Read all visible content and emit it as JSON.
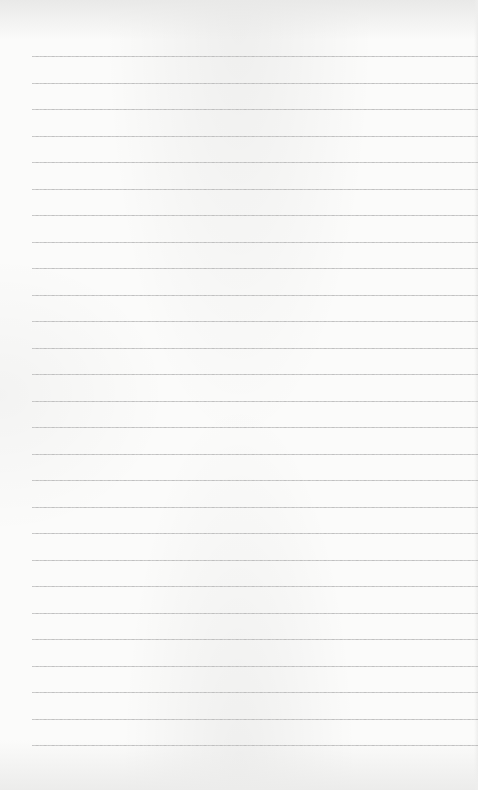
{
  "page": {
    "type": "lined-paper",
    "rule_color": "#bdbdbd",
    "background_color": "#fbfbfa",
    "rule_left_margin_px": 32,
    "rule_count": 27,
    "first_rule_y": 56,
    "rule_spacing_px": 26.5
  }
}
